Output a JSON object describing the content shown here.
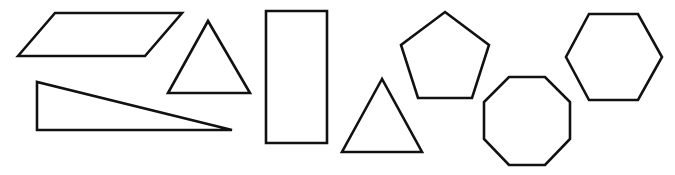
{
  "diagram": {
    "background": "#ffffff",
    "stroke_color": "#111111",
    "shapes": [
      {
        "name": "parallelogram",
        "points": "18,56 55,13 182,13 145,56"
      },
      {
        "name": "triangle-small",
        "points": "208,21 168,93 250,93"
      },
      {
        "name": "right-triangle",
        "points": "37,82 37,130 232,130"
      },
      {
        "name": "rectangle",
        "points": "266,11 327,11 327,143 266,143"
      },
      {
        "name": "triangle-lower",
        "points": "382,79 342,152 422,152"
      },
      {
        "name": "pentagon",
        "points": "445,12 489,45 472,98 418,98 401,45"
      },
      {
        "name": "octagon",
        "points": "509,77 545,77 570,102 570,139 545,165 509,165 484,139 484,102"
      },
      {
        "name": "hexagon",
        "points": "589,14 638,14 662,57 638,100 589,100 566,57"
      }
    ]
  }
}
